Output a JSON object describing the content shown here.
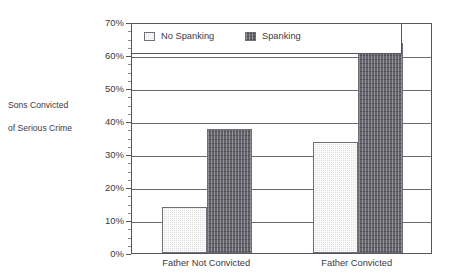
{
  "chart_data": {
    "type": "bar",
    "title": "",
    "xlabel": "",
    "ylabel": "Sons Convicted\nof Serious Crime",
    "categories": [
      "Father Not Convicted",
      "Father Convicted"
    ],
    "series": [
      {
        "name": "No Spanking",
        "values": [
          14,
          33.5
        ],
        "color": "#dededf"
      },
      {
        "name": "Spanking",
        "values": [
          37.5,
          63.5
        ],
        "color": "#63636c"
      }
    ],
    "ylim": [
      0,
      70
    ],
    "ytick_values": [
      0,
      10,
      20,
      30,
      40,
      50,
      60,
      70
    ],
    "ytick_labels": [
      "0%",
      "10%",
      "20%",
      "30%",
      "40%",
      "50%",
      "60%",
      "70%"
    ],
    "yminor_step": 2.5,
    "grid": "horizontal",
    "legend_position": "top-left-inside",
    "legend_entries": [
      "No Spanking",
      "Spanking"
    ]
  },
  "axis": {
    "y_title_line1": "Sons Convicted",
    "y_title_line2": "of Serious Crime"
  },
  "colors": {
    "frame": "#55555f",
    "grid": "#6a6a74",
    "text": "#3a3a46",
    "bar_light": "#dededf",
    "bar_dark": "#63636c"
  }
}
